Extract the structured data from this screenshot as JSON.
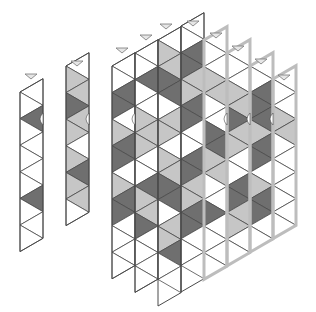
{
  "diagram": {
    "title": "Isometric cube tiling columns",
    "colors": {
      "white": "#ffffff",
      "light": "#c6c6c6",
      "dark": "#6f6f6f",
      "stroke": "#4a4a4a",
      "highlight_stroke": "#bdbdbd",
      "marker_fill": "#e6e6e6",
      "marker_stroke": "#777777"
    },
    "geometry": {
      "col_width": 23,
      "row_height": 26.6,
      "half": 13.3
    },
    "columns": [
      {
        "id": "strip-1",
        "x": 20,
        "top_left_y": 92,
        "highlight": false,
        "cells": [
          "white",
          "white",
          "dark",
          "white",
          "white",
          "white",
          "white",
          "white",
          "dark",
          "white",
          "white",
          "white"
        ]
      },
      {
        "id": "strip-2",
        "x": 66,
        "top_left_y": 66,
        "highlight": false,
        "cells": [
          "white",
          "light",
          "light",
          "dark",
          "light",
          "light",
          "white",
          "light",
          "dark",
          "light",
          "light",
          "white"
        ]
      },
      {
        "id": "block-col-1",
        "x": 112,
        "top_left_y": 66,
        "highlight": false,
        "cells": [
          "white",
          "white",
          "dark",
          "dark",
          "white",
          "light",
          "dark",
          "dark",
          "white",
          "light",
          "dark",
          "dark",
          "white",
          "white",
          "white",
          "white"
        ]
      },
      {
        "id": "block-col-2",
        "x": 135,
        "top_left_y": 53,
        "highlight": false,
        "cells": [
          "white",
          "white",
          "dark",
          "white",
          "white",
          "light",
          "light",
          "light",
          "white",
          "white",
          "dark",
          "light",
          "light",
          "dark",
          "white",
          "white",
          "white",
          "white"
        ]
      },
      {
        "id": "block-col-3",
        "x": 158,
        "top_left_y": 40,
        "highlight": false,
        "cells": [
          "white",
          "light",
          "light",
          "dark",
          "dark",
          "white",
          "light",
          "light",
          "white",
          "light",
          "light",
          "dark",
          "dark",
          "white",
          "light",
          "light",
          "dark",
          "white",
          "white"
        ]
      },
      {
        "id": "block-col-4",
        "x": 181,
        "top_left_y": 26,
        "highlight": false,
        "cells": [
          "white",
          "white",
          "dark",
          "dark",
          "light",
          "light",
          "dark",
          "dark",
          "white",
          "white",
          "dark",
          "dark",
          "light",
          "light",
          "dark",
          "dark",
          "white",
          "white",
          "white"
        ]
      },
      {
        "id": "block-col-5",
        "x": 204,
        "top_left_y": 40,
        "highlight": true,
        "cells": [
          "white",
          "white",
          "white",
          "light",
          "light",
          "white",
          "white",
          "dark",
          "dark",
          "light",
          "light",
          "white",
          "white",
          "dark",
          "white",
          "white",
          "white",
          "white"
        ]
      },
      {
        "id": "block-col-6",
        "x": 227,
        "top_left_y": 53,
        "highlight": true,
        "cells": [
          "white",
          "white",
          "white",
          "light",
          "light",
          "dark",
          "light",
          "light",
          "white",
          "white",
          "dark",
          "dark",
          "light",
          "light",
          "white",
          "white"
        ]
      },
      {
        "id": "block-col-7",
        "x": 250,
        "top_left_y": 66,
        "highlight": true,
        "cells": [
          "white",
          "white",
          "dark",
          "dark",
          "dark",
          "light",
          "dark",
          "dark",
          "white",
          "light",
          "dark",
          "dark",
          "white",
          "white"
        ]
      },
      {
        "id": "block-col-8",
        "x": 273,
        "top_left_y": 79,
        "highlight": true,
        "cells": [
          "white",
          "white",
          "white",
          "light",
          "light",
          "white",
          "white",
          "white",
          "white",
          "white",
          "white",
          "white"
        ]
      }
    ],
    "markers": [
      {
        "x": 31,
        "y": 76
      },
      {
        "x": 77,
        "y": 63
      },
      {
        "x": 122,
        "y": 50
      },
      {
        "x": 146,
        "y": 37
      },
      {
        "x": 166,
        "y": 26
      },
      {
        "x": 193,
        "y": 23
      },
      {
        "x": 216,
        "y": 35
      },
      {
        "x": 238,
        "y": 48
      },
      {
        "x": 261,
        "y": 61
      },
      {
        "x": 284,
        "y": 77
      }
    ],
    "notch_points": [
      {
        "x": 43,
        "y": 119
      },
      {
        "x": 89,
        "y": 119
      },
      {
        "x": 135,
        "y": 119
      },
      {
        "x": 227,
        "y": 119
      },
      {
        "x": 250,
        "y": 119
      },
      {
        "x": 273,
        "y": 119
      }
    ]
  }
}
